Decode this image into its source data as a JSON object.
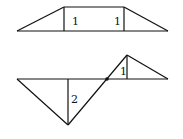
{
  "figure_top": {
    "description": "Trapezoid split into left triangle, middle rectangle, right triangle",
    "labels": [
      {
        "text": "1",
        "x": 72,
        "y": 25
      },
      {
        "text": "1",
        "x": 114,
        "y": 25
      }
    ]
  },
  "figure_bottom": {
    "description": "Large downward triangle and small upward triangle sharing a baseline, connected through a point",
    "labels": [
      {
        "text": "2",
        "x": 71,
        "y": 103
      },
      {
        "text": "1",
        "x": 120,
        "y": 75
      }
    ]
  },
  "colors": {
    "stroke": "#111111",
    "background": "#ffffff"
  }
}
